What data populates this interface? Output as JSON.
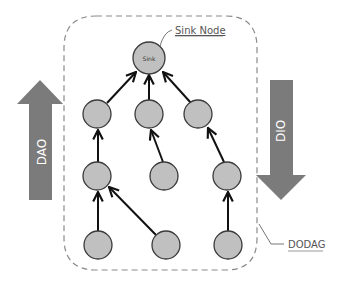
{
  "diagram": {
    "labels": {
      "sink_node": "Sink Node",
      "sink": "Sink",
      "dodag": "DODAG",
      "dao": "DAO",
      "dio": "DIO"
    },
    "colors": {
      "node_fill": "#c0c0c0",
      "node_stroke": "#3a3a3a",
      "arrow_fill": "#7b7b7b",
      "dashed_border": "#8a8a8a",
      "edge": "#111111",
      "label_text": "#555555"
    },
    "nodes": [
      {
        "id": "sink",
        "label": "Sink",
        "level": 0
      },
      {
        "id": "n1",
        "level": 1
      },
      {
        "id": "n2",
        "level": 1
      },
      {
        "id": "n3",
        "level": 1
      },
      {
        "id": "n4",
        "level": 2
      },
      {
        "id": "n5",
        "level": 2
      },
      {
        "id": "n6",
        "level": 2
      },
      {
        "id": "n7",
        "level": 3
      },
      {
        "id": "n8",
        "level": 3
      },
      {
        "id": "n9",
        "level": 3
      }
    ],
    "edges": [
      {
        "from": "n1",
        "to": "sink"
      },
      {
        "from": "n2",
        "to": "sink"
      },
      {
        "from": "n3",
        "to": "sink"
      },
      {
        "from": "n4",
        "to": "n1"
      },
      {
        "from": "n5",
        "to": "n2"
      },
      {
        "from": "n6",
        "to": "n3"
      },
      {
        "from": "n7",
        "to": "n4"
      },
      {
        "from": "n8",
        "to": "n4"
      },
      {
        "from": "n9",
        "to": "n6"
      }
    ]
  }
}
